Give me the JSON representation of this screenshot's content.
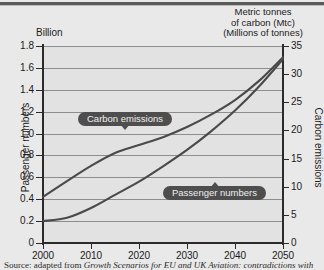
{
  "header": {
    "left_unit_label": "Billion",
    "right_unit_lines": [
      "Metric tonnes",
      "of carbon (Mtc)",
      "(Millions of tonnes)"
    ]
  },
  "axes": {
    "left_title": "Passenger numbers",
    "right_title": "Carbon emissions"
  },
  "callouts": {
    "carbon": "Carbon emissions",
    "passengers": "Passenger numbers"
  },
  "source": {
    "lead": "Source:",
    "text_before": " adapted from ",
    "italic_title": "Growth Scenarios for EU and UK Aviation: contradictions with",
    "text_after": ""
  },
  "chart_data": {
    "type": "line",
    "title": "",
    "subtitle": "",
    "xlabel": "",
    "ylabel": "Passenger numbers",
    "y2label": "Carbon emissions",
    "xlim": [
      2000,
      2050
    ],
    "ylim": [
      0,
      1.8
    ],
    "y2lim": [
      0,
      35
    ],
    "grid": true,
    "legend": "inline-callouts",
    "x_ticks": [
      2000,
      2010,
      2020,
      2030,
      2040,
      2050
    ],
    "x_tick_labels": [
      "2000",
      "2010",
      "2020",
      "2030",
      "2040",
      "2050"
    ],
    "y_ticks": [
      0,
      0.2,
      0.4,
      0.6,
      0.8,
      1.0,
      1.2,
      1.4,
      1.6,
      1.8
    ],
    "y_tick_labels": [
      "0",
      "0.2",
      "0.4",
      "0.6",
      "0.8",
      "1.0",
      "1.2",
      "1.4",
      "1.6",
      "1.8"
    ],
    "y2_ticks": [
      0,
      5,
      10,
      15,
      20,
      25,
      30,
      35
    ],
    "y2_tick_labels": [
      "0",
      "5",
      "10",
      "15",
      "20",
      "25",
      "30",
      "35"
    ],
    "x": [
      2000,
      2005,
      2010,
      2015,
      2020,
      2025,
      2030,
      2035,
      2040,
      2045,
      2050
    ],
    "series": [
      {
        "name": "Carbon emissions",
        "unit": "Mtc",
        "axis": "right",
        "values": [
          8.2,
          11.0,
          13.7,
          16.0,
          17.4,
          18.8,
          20.6,
          22.8,
          25.4,
          28.8,
          33.0
        ]
      },
      {
        "name": "Passenger numbers",
        "unit": "Billion",
        "axis": "left",
        "values": [
          0.2,
          0.23,
          0.32,
          0.44,
          0.56,
          0.7,
          0.85,
          1.02,
          1.21,
          1.43,
          1.68
        ]
      }
    ]
  }
}
